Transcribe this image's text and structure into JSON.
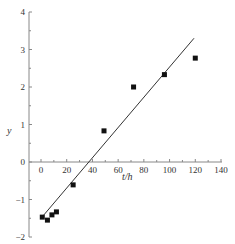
{
  "chart_data": {
    "type": "scatter",
    "title": "",
    "xlabel": "t/h",
    "ylabel": "y",
    "xlim": [
      0,
      140
    ],
    "ylim": [
      -2,
      4
    ],
    "x_ticks": [
      0,
      20,
      40,
      60,
      80,
      100,
      120,
      140
    ],
    "y_ticks": [
      -2,
      -1,
      0,
      1,
      2,
      3,
      4
    ],
    "x_tick_labels": [
      "0",
      "20",
      "40",
      "60",
      "80",
      "100",
      "120",
      "140"
    ],
    "y_tick_labels": [
      "-2",
      "-1",
      "0",
      "1",
      "2",
      "3",
      "4"
    ],
    "grid": false,
    "legend": null,
    "series": [
      {
        "name": "data",
        "marker": "square",
        "color": "#111111",
        "x": [
          1,
          5,
          8.5,
          12,
          25,
          49,
          72,
          96,
          120
        ],
        "y": [
          -1.47,
          -1.55,
          -1.41,
          -1.33,
          -0.61,
          0.83,
          2.0,
          2.33,
          2.77
        ]
      },
      {
        "name": "linear fit",
        "type": "line",
        "color": "#333333",
        "x": [
          1.5,
          119
        ],
        "y": [
          -1.44,
          3.3
        ]
      }
    ]
  }
}
